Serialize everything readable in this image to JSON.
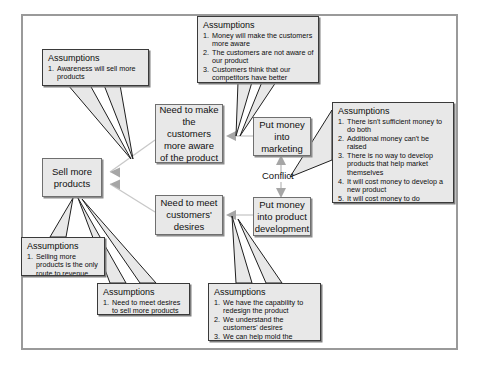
{
  "diagram": {
    "colors": {
      "node_fill": "#e8e8e8",
      "node_border": "#6f6f6f",
      "note_border": "#3a3a3a",
      "frame_border": "#9a9a9a",
      "text": "#111111"
    },
    "conflict_label": "Conflict",
    "nodes": [
      {
        "id": "sell-more-products",
        "label": "Sell more\nproducts"
      },
      {
        "id": "need-awareness",
        "label": "Need to make\nthe\ncustomers\nmore aware\nof the product"
      },
      {
        "id": "need-meet-desires",
        "label": "Need to meet\ncustomers'\ndesires"
      },
      {
        "id": "put-money-marketing",
        "label": "Put money\ninto\nmarketing"
      },
      {
        "id": "put-money-product-development",
        "label": "Put money\ninto product\ndevelopment"
      }
    ],
    "notes": [
      {
        "id": "note-awareness-sells",
        "title": "Assumptions",
        "items": [
          "Awareness will sell more products"
        ]
      },
      {
        "id": "note-money-awareness",
        "title": "Assumptions",
        "items": [
          "Money will make the customers more aware",
          "The customers are not aware of our product",
          "Customers think that our competitors have better features"
        ]
      },
      {
        "id": "note-conflict-money",
        "title": "Assumptions",
        "items": [
          "There isn't sufficient money to do both",
          "Additional money can't be raised",
          "There is no way to develop products that help market themselves",
          "It will cost money to develop a new product",
          "It will cost money to do marketing"
        ]
      },
      {
        "id": "note-selling-revenue",
        "title": "Assumptions",
        "items": [
          "Selling more products is the only route to revenue"
        ]
      },
      {
        "id": "note-meet-desires",
        "title": "Assumptions",
        "items": [
          "Need to meet desires to sell more products"
        ]
      },
      {
        "id": "note-capability",
        "title": "Assumptions",
        "items": [
          "We have the capability to redesign the product",
          "We understand the customers' desires",
          "We can help mold the desires"
        ]
      }
    ]
  }
}
